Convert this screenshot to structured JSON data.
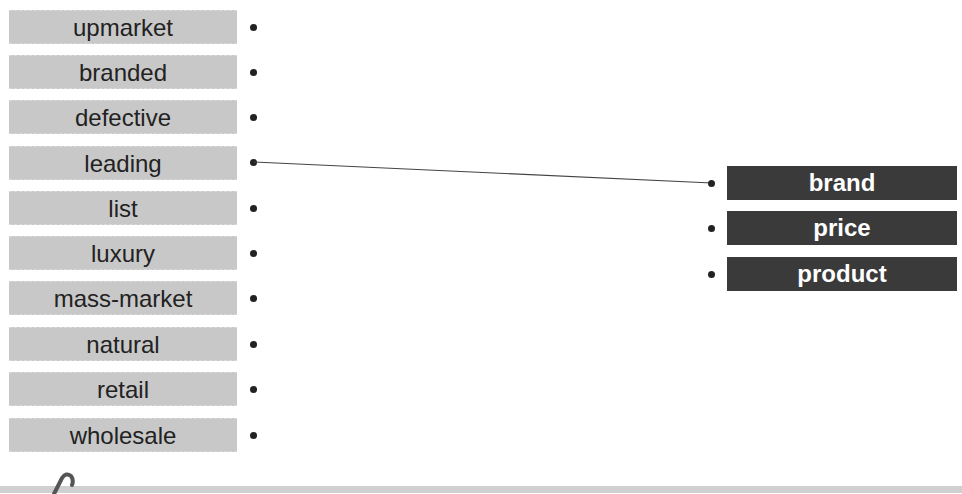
{
  "exercise": {
    "left_words": [
      "upmarket",
      "branded",
      "defective",
      "leading",
      "list",
      "luxury",
      "mass-market",
      "natural",
      "retail",
      "wholesale"
    ],
    "right_words": [
      "brand",
      "price",
      "product"
    ],
    "connections": [
      {
        "from": "leading",
        "to": "brand"
      }
    ]
  },
  "colors": {
    "left_box": "#c8c8c8",
    "right_box": "#3a3a3a",
    "dot": "#222222",
    "line": "#444444"
  },
  "icons": {
    "footer": "paperclip-icon"
  }
}
